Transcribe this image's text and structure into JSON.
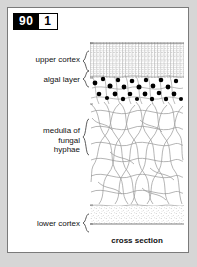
{
  "figure": {
    "badge_number": "90",
    "badge_index": "1",
    "caption": "cross section"
  },
  "labels": {
    "upper_cortex": "upper cortex",
    "algal_layer": "algal layer",
    "medulla_line1": "medulla of",
    "medulla_line2": "fungal",
    "medulla_line3": "hyphae",
    "lower_cortex": "lower cortex"
  },
  "diagram": {
    "layers": [
      {
        "name": "upper cortex",
        "texture": "dense vertical columnar cells",
        "top_fraction": 0.0,
        "bottom_fraction": 0.19
      },
      {
        "name": "algal layer",
        "texture": "black round algal cells among hyphae",
        "top_fraction": 0.19,
        "bottom_fraction": 0.33
      },
      {
        "name": "medulla of fungal hyphae",
        "texture": "loose tangled filaments",
        "top_fraction": 0.33,
        "bottom_fraction": 0.86
      },
      {
        "name": "lower cortex",
        "texture": "stippled dotted band",
        "top_fraction": 0.86,
        "bottom_fraction": 1.0
      }
    ]
  },
  "colors": {
    "page_background": "#d6d6d6",
    "card_background": "#ffffff",
    "card_border": "#7a7a7a",
    "badge_fill": "#000000",
    "badge_text": "#ffffff",
    "ink": "#111111",
    "hyphae": "#9a9a9a",
    "algal_cell": "#000000"
  }
}
